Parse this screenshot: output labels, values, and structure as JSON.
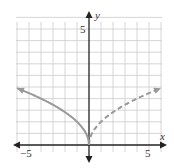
{
  "chart_data": {
    "type": "line",
    "title": "",
    "xlabel": "x",
    "ylabel": "y",
    "xlim": [
      -6.2,
      6.4
    ],
    "ylim": [
      -0.7,
      5.8
    ],
    "x_tick_labels": [
      {
        "value": -5,
        "label": "−5"
      },
      {
        "value": 5,
        "label": "5"
      }
    ],
    "y_tick_labels": [
      {
        "value": 5,
        "label": "5"
      }
    ],
    "grid": true,
    "grid_x_step": 1,
    "grid_y_step": 0.5,
    "series": [
      {
        "name": "y = sqrt(-x)",
        "style": "solid",
        "color": "#999999",
        "x": [
          -6,
          -5,
          -4,
          -3,
          -2,
          -1,
          -0.5,
          -0.1,
          0
        ],
        "y": [
          2.45,
          2.24,
          2.0,
          1.73,
          1.41,
          1.0,
          0.71,
          0.32,
          0
        ]
      },
      {
        "name": "y = sqrt(x)",
        "style": "dashed",
        "color": "#999999",
        "x": [
          0,
          0.1,
          0.5,
          1,
          2,
          3,
          4,
          5,
          6
        ],
        "y": [
          0,
          0.32,
          0.71,
          1.0,
          1.41,
          1.73,
          2.0,
          2.24,
          2.45
        ]
      }
    ]
  },
  "labels": {
    "x_axis": "x",
    "y_axis": "y",
    "x_neg5": "−5",
    "x_pos5": "5",
    "y_pos5": "5"
  },
  "colors": {
    "grid": "#cccccc",
    "axis": "#222222",
    "curve": "#999999"
  }
}
